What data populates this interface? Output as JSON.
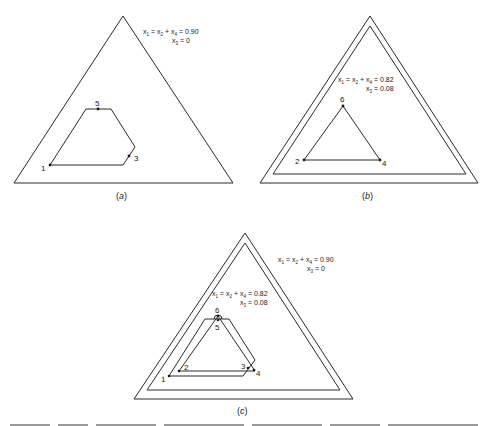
{
  "panels": [
    {
      "id": "a",
      "caption": "(a)",
      "caption_letter": "a",
      "equations": [
        {
          "text": "x1 = x2 + x4 = 0.90",
          "parts": [
            "x",
            "1",
            " = x",
            "2",
            " + x",
            "4",
            " = 0.90"
          ]
        },
        {
          "text": "x3 = 0",
          "parts": [
            "x",
            "3",
            " = 0"
          ]
        }
      ],
      "points": [
        {
          "label": "1"
        },
        {
          "label": "3"
        },
        {
          "label": "5"
        }
      ]
    },
    {
      "id": "b",
      "caption": "(b)",
      "caption_letter": "b",
      "equations": [
        {
          "text": "x1 = x2 + x4 = 0.82",
          "parts": [
            "x",
            "1",
            " = x",
            "2",
            " + x",
            "4",
            " = 0.82"
          ]
        },
        {
          "text": "x3 = 0.08",
          "parts": [
            "x",
            "3",
            " = 0.08"
          ]
        }
      ],
      "points": [
        {
          "label": "2"
        },
        {
          "label": "4"
        },
        {
          "label": "6"
        }
      ]
    },
    {
      "id": "c",
      "caption": "(c)",
      "caption_letter": "c",
      "equations": [
        {
          "text": "x1 = x2 + x4 = 0.90",
          "parts": [
            "x",
            "1",
            " = x",
            "2",
            " + x",
            "4",
            " = 0.90"
          ]
        },
        {
          "text": "x3 = 0",
          "parts": [
            "x",
            "3",
            " = 0"
          ]
        },
        {
          "text": "x1 = x2 + x4 = 0.82",
          "parts": [
            "x",
            "1",
            " = x",
            "2",
            " + x",
            "4",
            " = 0.82"
          ]
        },
        {
          "text": "x3 = 0.08",
          "parts": [
            "x",
            "3",
            " = 0.08"
          ]
        }
      ],
      "points": [
        {
          "label": "1"
        },
        {
          "label": "2"
        },
        {
          "label": "3"
        },
        {
          "label": "4"
        },
        {
          "label": "5"
        },
        {
          "label": "6"
        }
      ]
    }
  ],
  "colors": {
    "stroke": "#2a2a2a",
    "background": "#ffffff"
  }
}
